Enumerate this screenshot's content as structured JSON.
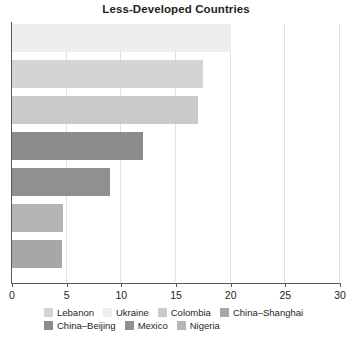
{
  "chart_data": {
    "type": "bar",
    "orientation": "horizontal",
    "title": "Less-Developed Countries",
    "xlabel": "",
    "ylabel": "",
    "xlim": [
      0,
      30
    ],
    "xticks": [
      0,
      5,
      10,
      15,
      20,
      25,
      30
    ],
    "grid": true,
    "legend_position": "bottom",
    "categories": [
      "Ukraine",
      "Lebanon",
      "Colombia",
      "China–Beijing",
      "Mexico",
      "Nigeria",
      "China–Shanghai"
    ],
    "values": [
      20.0,
      17.5,
      17.0,
      12.0,
      9.0,
      4.7,
      4.6
    ],
    "bars": [
      {
        "label": "Ukraine",
        "value": 20.0,
        "color": "#eeeeee"
      },
      {
        "label": "Lebanon",
        "value": 17.5,
        "color": "#d3d4d4"
      },
      {
        "label": "Colombia",
        "value": 17.0,
        "color": "#c9caca"
      },
      {
        "label": "China–Beijing",
        "value": 12.0,
        "color": "#8c8c8c"
      },
      {
        "label": "Mexico",
        "value": 9.0,
        "color": "#8f9091"
      },
      {
        "label": "Nigeria",
        "value": 4.7,
        "color": "#b4b5b5"
      },
      {
        "label": "China–Shanghai",
        "value": 4.6,
        "color": "#a6a7a8"
      }
    ],
    "legend": [
      {
        "label": "Lebanon",
        "color": "#d3d4d4"
      },
      {
        "label": "Ukraine",
        "color": "#eeeeee"
      },
      {
        "label": "Colombia",
        "color": "#c9caca"
      },
      {
        "label": "China–Shanghai",
        "color": "#a6a7a8"
      },
      {
        "label": "China–Beijing",
        "color": "#8c8c8c"
      },
      {
        "label": "Mexico",
        "color": "#8f9091"
      },
      {
        "label": "Nigeria",
        "color": "#b4b5b5"
      }
    ],
    "axis_color": "#58595b",
    "grid_color": "#e2e2e2"
  }
}
